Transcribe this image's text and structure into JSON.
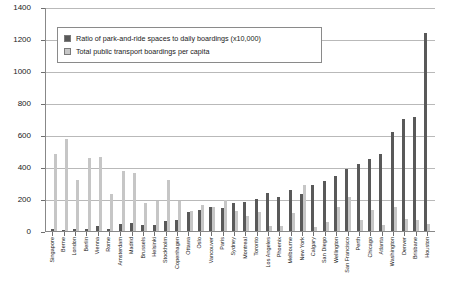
{
  "chart_data": {
    "type": "bar",
    "title": "",
    "xlabel": "",
    "ylabel": "",
    "ylim": [
      0,
      1400
    ],
    "yticks": [
      0,
      200,
      400,
      600,
      800,
      1000,
      1200,
      1400
    ],
    "grid": true,
    "legend_position": "upper-left-inside",
    "categories": [
      "Singapore",
      "Berne",
      "London",
      "Berlin",
      "Vienna",
      "Rome",
      "Amsterdam",
      "Madrid",
      "Brussels",
      "Helsinki",
      "Stockholm",
      "Copenhagen",
      "Ottawa",
      "Oslo",
      "Vancouver",
      "Paris",
      "Sydney",
      "Montreal",
      "Toronto",
      "Los Angeles",
      "Phoenix",
      "Melbourne",
      "New York",
      "Calgary",
      "San Diego",
      "Wellington",
      "San Francisco",
      "Perth",
      "Chicago",
      "Atlanta",
      "Washington",
      "Denver",
      "Brisbane",
      "Houston"
    ],
    "series": [
      {
        "name": "Ratio of park-and-ride spaces to daily boardings (x10,000)",
        "color": "#595959",
        "values": [
          10,
          8,
          12,
          10,
          30,
          12,
          45,
          50,
          35,
          40,
          60,
          70,
          120,
          130,
          150,
          145,
          175,
          180,
          200,
          240,
          215,
          255,
          230,
          290,
          310,
          345,
          390,
          420,
          450,
          480,
          620,
          700,
          715,
          1240
        ]
      },
      {
        "name": "Total public transport boardings per capita",
        "color": "#c6c6c6",
        "values": [
          480,
          575,
          320,
          455,
          460,
          230,
          375,
          365,
          175,
          190,
          320,
          185,
          125,
          165,
          150,
          195,
          125,
          95,
          120,
          30,
          30,
          115,
          290,
          25,
          55,
          150,
          215,
          70,
          130,
          35,
          150,
          75,
          70,
          45
        ]
      }
    ]
  },
  "legend": {
    "items": [
      {
        "label": "Ratio of park-and-ride spaces to daily boardings (x10,000)",
        "swatch": "series-dark"
      },
      {
        "label": "Total public transport boardings per capita",
        "swatch": "series-light"
      }
    ]
  },
  "colors": {
    "series_dark": "#595959",
    "series_light": "#c6c6c6",
    "gridline": "#b9b9b9",
    "axis": "#888888",
    "text": "#1a1a1a"
  }
}
